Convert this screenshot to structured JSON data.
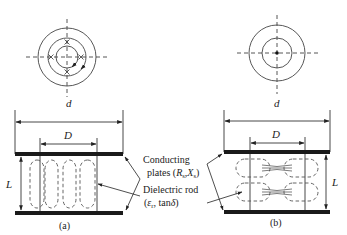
{
  "diagram": {
    "panels": [
      {
        "id": "a",
        "caption": "(a)",
        "dim_outer": "d",
        "dim_inner": "D",
        "dim_height": "L",
        "top_view": "three concentric circles with x-marked field points and arrows",
        "side_view": "dielectric rod between plates with four vertical dashed field loops"
      },
      {
        "id": "b",
        "caption": "(b)",
        "dim_outer": "d",
        "dim_inner": "D",
        "dim_height": "L",
        "top_view": "two concentric circles with center dot",
        "side_view": "dielectric rod between plates with two rows of horizontal dashed field loops"
      }
    ],
    "labels": {
      "conducting_line1": "Conducting",
      "conducting_line2_prefix": "plates (",
      "conducting_R": "R",
      "conducting_R_sub": "s",
      "conducting_comma": ",",
      "conducting_X": "X",
      "conducting_X_sub": "s",
      "conducting_close": ")",
      "dielectric_line1": "Dielectric rod",
      "dielectric_line2_open": "(",
      "dielectric_eps": "ε",
      "dielectric_eps_sub": "r",
      "dielectric_tan": ", tan",
      "dielectric_delta": "δ",
      "dielectric_close": ")"
    },
    "colors": {
      "line": "#333333",
      "plate": "#1a1a1a",
      "background": "#ffffff"
    }
  }
}
